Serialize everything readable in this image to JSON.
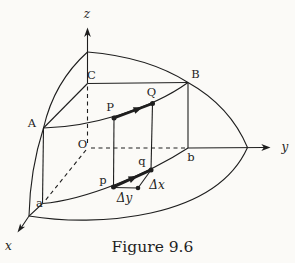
{
  "figure": {
    "caption": "Figure 9.6",
    "colors": {
      "background": "#fbfaf7",
      "line": "#1e1e1e"
    }
  },
  "axis_labels": {
    "x": "x",
    "y": "y",
    "z": "z"
  },
  "point_labels": {
    "A": "A",
    "B": "B",
    "C": "C",
    "O": "O",
    "P": "P",
    "Q": "Q",
    "a": "a",
    "b": "b",
    "p": "p",
    "q": "q"
  },
  "increment_labels": {
    "delta_x": "Δx",
    "delta_y": "Δy"
  }
}
